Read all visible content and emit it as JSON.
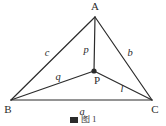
{
  "figure": {
    "type": "geometry-diagram",
    "background_color": "#ffffff",
    "stroke_color": "#2b2b2b",
    "text_color": "#2b2b2b",
    "vertices": [
      {
        "id": "A",
        "label": "A",
        "x": 95,
        "y": 17,
        "label_x": 95,
        "label_y": 10
      },
      {
        "id": "B",
        "label": "B",
        "x": 11,
        "y": 100,
        "label_x": 8,
        "label_y": 113
      },
      {
        "id": "C",
        "label": "C",
        "x": 152,
        "y": 100,
        "label_x": 155,
        "label_y": 113
      },
      {
        "id": "P",
        "label": "P",
        "x": 94,
        "y": 71,
        "label_x": 97,
        "label_y": 84
      }
    ],
    "interior_point_marker": {
      "id": "P",
      "x": 94,
      "y": 71,
      "radius": 2.6
    },
    "segments": [
      {
        "id": "AB",
        "from": "A",
        "to": "B",
        "label": "c",
        "label_x": 47,
        "label_y": 56
      },
      {
        "id": "AC",
        "from": "A",
        "to": "C",
        "label": "b",
        "label_x": 130,
        "label_y": 56
      },
      {
        "id": "BC",
        "from": "B",
        "to": "C",
        "label": "a",
        "label_x": 82,
        "label_y": 115
      },
      {
        "id": "PA",
        "from": "P",
        "to": "A",
        "label": "p",
        "label_x": 86,
        "label_y": 53
      },
      {
        "id": "PB",
        "from": "P",
        "to": "B",
        "label": "q",
        "label_x": 58,
        "label_y": 80
      },
      {
        "id": "PC",
        "from": "P",
        "to": "C",
        "label": "l",
        "label_x": 122,
        "label_y": 92
      }
    ]
  },
  "caption": {
    "text": "图 1",
    "clipped": true
  }
}
